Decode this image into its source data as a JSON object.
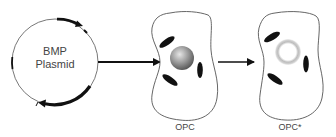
{
  "diagram": {
    "plasmid": {
      "label_line1": "BMP",
      "label_line2": "Plasmid"
    },
    "cells": [
      {
        "label": "OPC",
        "nucleus": "solid-gray-sphere"
      },
      {
        "label": "OPC*",
        "nucleus": "hollow-halo-ring"
      }
    ],
    "arrows": [
      {
        "from": "plasmid",
        "to": "OPC"
      },
      {
        "from": "OPC",
        "to": "OPC*"
      }
    ],
    "colors": {
      "stroke": "#111111",
      "outline": "#555555",
      "nucleus": "#8a8a8a",
      "background": "#ffffff"
    }
  }
}
